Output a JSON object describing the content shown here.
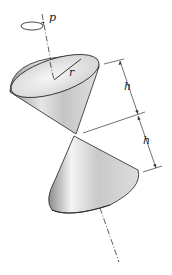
{
  "figure": {
    "type": "double-cone-diagram",
    "labels": {
      "rotation": "p",
      "radius": "r",
      "height_upper": "h",
      "height_lower": "h"
    },
    "colors": {
      "line": "#222222",
      "cone_light": "#f2f2f2",
      "cone_mid": "#c8c8c8",
      "cone_dark": "#8a8a8a"
    }
  }
}
